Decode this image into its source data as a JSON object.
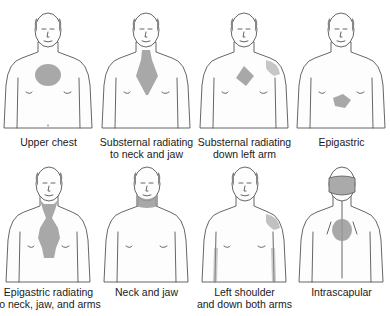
{
  "diagram": {
    "type": "anatomical-pain-location-grid",
    "layout": {
      "rows": 2,
      "columns": 4
    },
    "pain_color": "#9a9a9a",
    "panels": [
      {
        "id": "upper-chest",
        "view": "front",
        "label_line1": "Upper chest",
        "label_line2": "",
        "regions": [
          "upper-chest-circle"
        ]
      },
      {
        "id": "substernal-neck-jaw",
        "view": "front",
        "label_line1": "Substernal radiating",
        "label_line2": "to neck and jaw",
        "regions": [
          "substernal-diamond-to-neck"
        ]
      },
      {
        "id": "substernal-left-arm",
        "view": "front",
        "label_line1": "Substernal radiating",
        "label_line2": "down left arm",
        "regions": [
          "substernal-diamond",
          "left-shoulder"
        ]
      },
      {
        "id": "epigastric",
        "view": "front",
        "label_line1": "Epigastric",
        "label_line2": "",
        "regions": [
          "epigastric-patch"
        ]
      },
      {
        "id": "epigastric-neck-jaw-arms",
        "view": "front",
        "label_line1": "Epigastric radiating",
        "label_line2": "to neck, jaw, and arms",
        "regions": [
          "epigastric-column-to-neck"
        ]
      },
      {
        "id": "neck-jaw",
        "view": "front",
        "label_line1": "Neck and jaw",
        "label_line2": "",
        "regions": [
          "neck-jaw-band"
        ]
      },
      {
        "id": "left-shoulder-both-arms",
        "view": "front",
        "label_line1": "Left shoulder",
        "label_line2": "and down both arms",
        "regions": [
          "left-shoulder",
          "both-inner-arms"
        ]
      },
      {
        "id": "intrascapular",
        "view": "back",
        "label_line1": "Intrascapular",
        "label_line2": "",
        "regions": [
          "between-shoulder-blades-circle"
        ]
      }
    ]
  }
}
